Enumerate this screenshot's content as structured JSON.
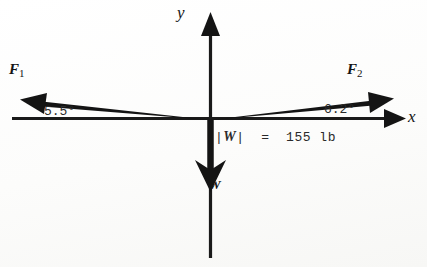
{
  "figure": {
    "kind": "free-body-force-diagram",
    "background_color": "#fdfdfc",
    "ink_color": "#141414",
    "axes": {
      "x_label": "x",
      "y_label": "y",
      "origin": {
        "x": 210,
        "y": 119
      }
    },
    "vectors": [
      {
        "name": "F",
        "subscript": "1",
        "label": "F",
        "direction": "left-and-slightly-up",
        "angle_label": "5.5°",
        "angle_value": 5.5,
        "angle_unit": "degrees",
        "tip": {
          "x": 22,
          "y": 99
        }
      },
      {
        "name": "F",
        "subscript": "2",
        "label": "F",
        "direction": "right-and-slightly-up",
        "angle_label": "6.2°",
        "angle_value": 6.2,
        "angle_unit": "degrees",
        "tip": {
          "x": 393,
          "y": 99
        }
      },
      {
        "name": "W",
        "subscript": "",
        "label": "W",
        "direction": "straight-down",
        "angle_label": "",
        "tip": {
          "x": 210,
          "y": 190
        }
      }
    ],
    "annotations": {
      "weight_magnitude": {
        "variable": "W",
        "bars": "|",
        "equals": "=",
        "value": "155",
        "unit": "lb",
        "full_text": "|W| = 155 lb"
      }
    }
  }
}
